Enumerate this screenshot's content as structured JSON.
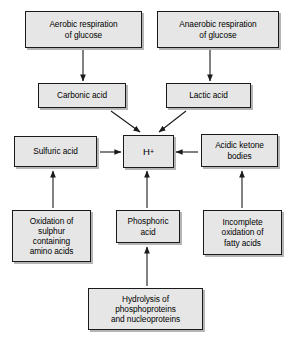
{
  "diagram": {
    "type": "flowchart",
    "canvas": {
      "width": 292,
      "height": 341,
      "background": "#ffffff"
    },
    "style": {
      "node_fill": "#e6e6e6",
      "node_border": "#1a1a1a",
      "arrow_color": "#1a1a1a",
      "text_color": "#000000"
    },
    "nodes": [
      {
        "id": "aerobic",
        "label": "Aerobic respiration\nof glucose",
        "x": 25,
        "y": 11,
        "w": 117,
        "h": 37
      },
      {
        "id": "anaerobic",
        "label": "Anaerobic respiration\nof glucose",
        "x": 157,
        "y": 11,
        "w": 122,
        "h": 37
      },
      {
        "id": "carbonic",
        "label": "Carbonic acid",
        "x": 38,
        "y": 83,
        "w": 88,
        "h": 25
      },
      {
        "id": "lactic",
        "label": "Lactic acid",
        "x": 166,
        "y": 83,
        "w": 85,
        "h": 25
      },
      {
        "id": "sulfuric",
        "label": "Sulfuric acid",
        "x": 14,
        "y": 136,
        "w": 83,
        "h": 31
      },
      {
        "id": "hydrogen",
        "label": "H",
        "superscript": "+",
        "x": 123,
        "y": 135,
        "w": 51,
        "h": 33
      },
      {
        "id": "ketone",
        "label": "Acidic ketone\nbodies",
        "x": 201,
        "y": 134,
        "w": 77,
        "h": 33
      },
      {
        "id": "sulphur-oxidation",
        "label": "Oxidation of\nsulphur\ncontaining\namino acids",
        "x": 12,
        "y": 210,
        "w": 79,
        "h": 52
      },
      {
        "id": "phosphoric",
        "label": "Phosphoric\nacid",
        "x": 116,
        "y": 210,
        "w": 64,
        "h": 33
      },
      {
        "id": "fatty-acid-oxidation",
        "label": "Incomplete\noxidation of\nfatty acids",
        "x": 203,
        "y": 210,
        "w": 79,
        "h": 45
      },
      {
        "id": "hydrolysis",
        "label": "Hydrolysis of\nphosphoproteins\nand nucleoproteins",
        "x": 88,
        "y": 288,
        "w": 115,
        "h": 42
      }
    ],
    "edges": [
      {
        "id": "aerobic-to-carbonic",
        "from": "aerobic",
        "to": "carbonic",
        "direction": "down",
        "x1": 83,
        "y1": 50,
        "x2": 83,
        "y2": 81
      },
      {
        "id": "anaerobic-to-lactic",
        "from": "anaerobic",
        "to": "lactic",
        "direction": "down",
        "x1": 210,
        "y1": 50,
        "x2": 210,
        "y2": 81
      },
      {
        "id": "carbonic-to-hydrogen",
        "from": "carbonic",
        "to": "hydrogen",
        "direction": "diagonal-down-right",
        "x1": 111,
        "y1": 111,
        "x2": 140,
        "y2": 132
      },
      {
        "id": "lactic-to-hydrogen",
        "from": "lactic",
        "to": "hydrogen",
        "direction": "diagonal-down-left",
        "x1": 186,
        "y1": 111,
        "x2": 159,
        "y2": 132
      },
      {
        "id": "sulfuric-to-hydrogen",
        "from": "sulfuric",
        "to": "hydrogen",
        "direction": "right",
        "x1": 100,
        "y1": 152,
        "x2": 121,
        "y2": 152
      },
      {
        "id": "ketone-to-hydrogen",
        "from": "ketone",
        "to": "hydrogen",
        "direction": "left",
        "x1": 198,
        "y1": 152,
        "x2": 176,
        "y2": 152
      },
      {
        "id": "sulphur-oxidation-to-sulfuric",
        "from": "sulphur-oxidation",
        "to": "sulfuric",
        "direction": "up",
        "x1": 53,
        "y1": 208,
        "x2": 53,
        "y2": 171
      },
      {
        "id": "phosphoric-to-hydrogen",
        "from": "phosphoric",
        "to": "hydrogen",
        "direction": "up",
        "x1": 147,
        "y1": 208,
        "x2": 147,
        "y2": 171
      },
      {
        "id": "fatty-acid-oxidation-to-ketone",
        "from": "fatty-acid-oxidation",
        "to": "ketone",
        "direction": "up",
        "x1": 242,
        "y1": 208,
        "x2": 242,
        "y2": 171
      },
      {
        "id": "hydrolysis-to-phosphoric",
        "from": "hydrolysis",
        "to": "phosphoric",
        "direction": "up",
        "x1": 147,
        "y1": 286,
        "x2": 147,
        "y2": 247
      }
    ]
  }
}
